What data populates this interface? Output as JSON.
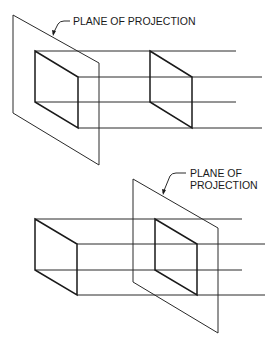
{
  "figure": {
    "top": {
      "label": "PLANE OF PROJECTION"
    },
    "bottom": {
      "label_line1": "PLANE OF",
      "label_line2": "PROJECTION"
    }
  },
  "colors": {
    "line": "#2a2a2a",
    "background": "#ffffff"
  }
}
